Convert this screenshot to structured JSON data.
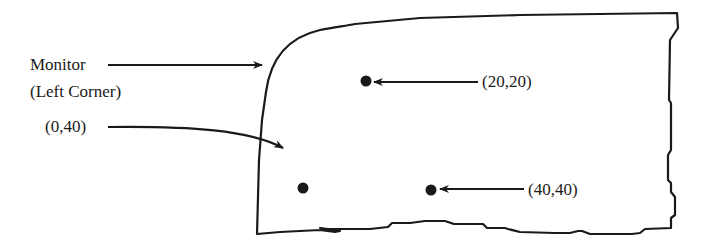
{
  "diagram": {
    "type": "annotated-coordinate-diagram",
    "colors": {
      "stroke": "#1a1a1a",
      "background": "#ffffff"
    },
    "labels": {
      "monitor_line1": "Monitor",
      "monitor_line2": "(Left Corner)",
      "point_a": "(20,20)",
      "point_b": "(0,40)",
      "point_c": "(40,40)"
    },
    "points": [
      {
        "label": "(20,20)",
        "x": 20,
        "y": 20
      },
      {
        "label": "(0,40)",
        "x": 0,
        "y": 40
      },
      {
        "label": "(40,40)",
        "x": 40,
        "y": 40
      }
    ]
  }
}
